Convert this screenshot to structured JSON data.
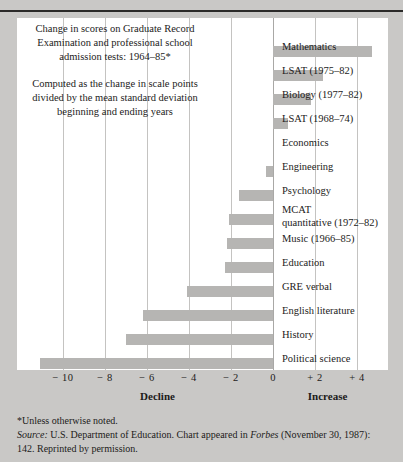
{
  "chart_data": {
    "type": "bar",
    "orientation": "horizontal",
    "title": "Change in scores on Graduate Record Examination and professional school admission tests: 1964–85*",
    "subtitle": "Computed as the change in scale points divided by the mean standard deviation beginning and ending years",
    "xlabel": "",
    "ylabel": "",
    "xlim": [
      -11.8,
      5.2
    ],
    "grid": true,
    "legend": "none",
    "axis_left_title": "Decline",
    "axis_right_title": "Increase",
    "tick_values": [
      -10,
      -8,
      -6,
      -4,
      -2,
      0,
      2,
      4
    ],
    "tick_labels": [
      "− 10",
      "− 8",
      "− 6",
      "− 4",
      "− 2",
      "0",
      "+ 2",
      "+ 4"
    ],
    "bar_color": "#b6b5b3",
    "categories": [
      "Mathematics",
      "LSAT (1975–82)",
      "Biology (1977–82)",
      "LSAT (1968–74)",
      "Economics",
      "Engineering",
      "Psychology",
      "MCAT\nquantitative (1972–82)",
      "Music (1966–85)",
      "Education",
      "GRE verbal",
      "English literature",
      "History",
      "Political science"
    ],
    "values": [
      4.7,
      2.4,
      1.8,
      0.7,
      0.0,
      -0.35,
      -1.6,
      -2.1,
      -2.2,
      -2.3,
      -4.1,
      -6.2,
      -7.0,
      -11.1
    ]
  },
  "rows": [
    {
      "label": "Mathematics",
      "value": 4.7,
      "two_line": false
    },
    {
      "label": "LSAT (1975–82)",
      "value": 2.4,
      "two_line": false
    },
    {
      "label": "Biology (1977–82)",
      "value": 1.8,
      "two_line": false
    },
    {
      "label": "LSAT (1968–74)",
      "value": 0.7,
      "two_line": false
    },
    {
      "label": "Economics",
      "value": 0.0,
      "two_line": false
    },
    {
      "label": "Engineering",
      "value": -0.35,
      "two_line": false
    },
    {
      "label": "Psychology",
      "value": -1.6,
      "two_line": false
    },
    {
      "label": "MCAT\nquantitative (1972–82)",
      "value": -2.1,
      "two_line": true
    },
    {
      "label": "Music (1966–85)",
      "value": -2.2,
      "two_line": false
    },
    {
      "label": "Education",
      "value": -2.3,
      "two_line": false
    },
    {
      "label": "GRE verbal",
      "value": -4.1,
      "two_line": false
    },
    {
      "label": "English literature",
      "value": -6.2,
      "two_line": false
    },
    {
      "label": "History",
      "value": -7.0,
      "two_line": false
    },
    {
      "label": "Political science",
      "value": -11.1,
      "two_line": false
    }
  ],
  "caption": {
    "line1": "Change in scores on Graduate Record Examination and professional school admission tests: 1964–85*",
    "line2": "Computed as the change in scale points divided by the mean standard deviation beginning and ending years"
  },
  "axis": {
    "tick_labels": [
      "− 10",
      "− 8",
      "− 6",
      "− 4",
      "− 2",
      "0",
      "+ 2",
      "+ 4"
    ],
    "decline_label": "Decline",
    "increase_label": "Increase"
  },
  "footnotes": {
    "asterisk": "*Unless otherwise noted.",
    "source_label": "Source:",
    "source_text_1": " U.S. Department of Education. Chart appeared in ",
    "source_italic": "Forbes",
    "source_text_2": " (November 30, 1987): 142. Reprinted by permission."
  }
}
